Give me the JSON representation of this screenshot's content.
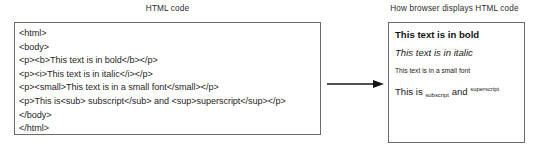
{
  "captions": {
    "code_panel": "HTML code",
    "browser_panel": "How browser displays HTML code"
  },
  "code_panel": {
    "lines": [
      "<html>",
      "<body>",
      "<p><b>This text is in bold</b></p>",
      "<p><i>This text is in italic</i></p>",
      "<p><small>This text is in a small font</small></p>",
      "<p>This is<sub> subscript</sub> and <sup>superscript</sup></p>",
      "</body>",
      "</html>"
    ]
  },
  "browser_panel": {
    "bold_line": "This text is in bold",
    "italic_line": "This text is in italic",
    "small_line": "This text is in a small font",
    "subsup": {
      "lead": "This is",
      "subscript": "subscript",
      "middle": "and",
      "superscript": "superscript"
    }
  },
  "arrow": {
    "icon": "arrow-right-icon"
  },
  "colors": {
    "border": "#6b6b6b",
    "text": "#1c1c1c",
    "background": "#ffffff"
  }
}
